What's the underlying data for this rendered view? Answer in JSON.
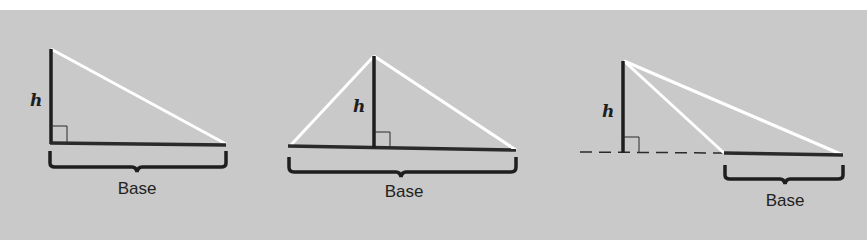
{
  "colors": {
    "background": "#c9c9c9",
    "height_line": "#1e1e1e",
    "base_line": "#2a2a2a",
    "side_line": "#ffffff",
    "brace": "#1e1e1e"
  },
  "figures": [
    {
      "name": "right-triangle",
      "height_label": "h",
      "base_label": "Base"
    },
    {
      "name": "acute-triangle",
      "height_label": "h",
      "base_label": "Base"
    },
    {
      "name": "obtuse-triangle",
      "height_label": "h",
      "base_label": "Base"
    }
  ]
}
